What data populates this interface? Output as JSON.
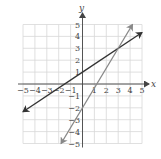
{
  "chart_data": {
    "type": "line",
    "title": "",
    "xlabel": "x",
    "ylabel": "y",
    "xlim": [
      -5,
      5
    ],
    "ylim": [
      -5,
      5
    ],
    "grid": true,
    "x_ticks": [
      "-5",
      "-4",
      "-3",
      "-2",
      "-1",
      "1",
      "2",
      "3",
      "4",
      "5"
    ],
    "y_ticks": [
      "5",
      "4",
      "3",
      "2",
      "1",
      "-1",
      "-2",
      "-3",
      "-4",
      "-5"
    ],
    "series": [
      {
        "name": "line-1",
        "equation": "y = (2/3)x + 1",
        "color": "#333333",
        "points": [
          [
            -5,
            -2.33
          ],
          [
            -1.5,
            0
          ],
          [
            0,
            1
          ],
          [
            3,
            3
          ],
          [
            5,
            4.33
          ]
        ],
        "arrows": "both"
      },
      {
        "name": "line-2",
        "equation": "y = (5/3)x - 2",
        "color": "#888888",
        "points": [
          [
            -1.8,
            -5
          ],
          [
            0,
            -2
          ],
          [
            1.2,
            0
          ],
          [
            3,
            3
          ],
          [
            4.2,
            5
          ]
        ],
        "arrows": "both"
      }
    ],
    "intersection": [
      3,
      3
    ]
  },
  "labels": {
    "x": "x",
    "y": "y"
  },
  "colors": {
    "grid": "#d8d8d8",
    "axis": "#444444",
    "line1": "#333333",
    "line2": "#888888"
  }
}
